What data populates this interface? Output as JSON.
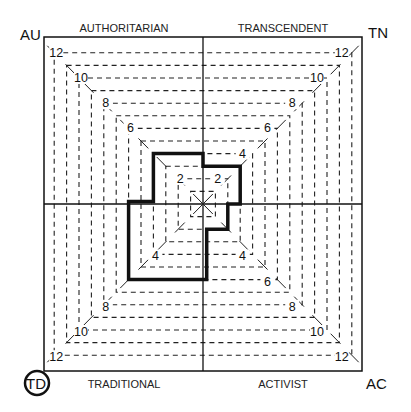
{
  "corners": {
    "top_left": "AU",
    "top_right": "TN",
    "bottom_left": "TD",
    "bottom_right": "AC",
    "highlighted": "TD"
  },
  "sides": {
    "top_left": "AUTHORITARIAN",
    "top_right": "TRANSCENDENT",
    "bottom_left": "TRADITIONAL",
    "bottom_right": "ACTIVIST"
  },
  "scale": {
    "max": 12,
    "rings": [
      1,
      2,
      3,
      4,
      5,
      6,
      7,
      8,
      9,
      10,
      11,
      12
    ],
    "labels": {
      "top_left": [
        "2",
        "6",
        "8",
        "10",
        "12"
      ],
      "top_right": [
        "2",
        "4",
        "6",
        "8",
        "10",
        "12"
      ],
      "bottom_left": [
        "4",
        "8",
        "10",
        "12"
      ],
      "bottom_right": [
        "4",
        "6",
        "8",
        "10",
        "12"
      ]
    }
  },
  "profile": {
    "authoritarian": 4,
    "transcendent": 3,
    "activist": 2,
    "traditional": 6
  },
  "colors": {
    "line": "#111111",
    "background": "#ffffff"
  }
}
